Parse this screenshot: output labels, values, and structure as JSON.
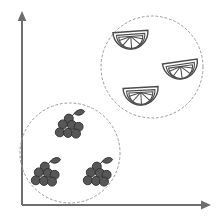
{
  "figure": {
    "type": "cluster-scatter-diagram",
    "background_color": "#ffffff",
    "width": 218,
    "height": 222
  },
  "axes": {
    "color": "#6e6e6e",
    "x_axis": {
      "name": "x-axis",
      "label": "",
      "from": [
        22,
        205
      ],
      "to": [
        208,
        205
      ],
      "arrow": "right"
    },
    "y_axis": {
      "name": "y-axis",
      "label": "",
      "from": [
        22,
        205
      ],
      "to": [
        22,
        14
      ],
      "arrow": "up"
    }
  },
  "clusters": [
    {
      "id": "citrus-cluster",
      "label": "",
      "ring_color": "#9b9b9b",
      "ring_style": "dashed",
      "center": [
        152,
        67
      ],
      "radius": 51,
      "member_icon": "citrus-slice-icon",
      "member_count": 3,
      "members": [
        {
          "id": "citrus-slice-1",
          "icon": "citrus-slice-icon",
          "center": [
            131,
            40
          ],
          "scale": 1.0,
          "rotation": -4
        },
        {
          "id": "citrus-slice-2",
          "icon": "citrus-slice-icon",
          "center": [
            181,
            70
          ],
          "scale": 1.0,
          "rotation": -8
        },
        {
          "id": "citrus-slice-3",
          "icon": "citrus-slice-icon",
          "center": [
            141,
            96
          ],
          "scale": 1.0,
          "rotation": -3
        }
      ]
    },
    {
      "id": "grape-cluster",
      "label": "",
      "ring_color": "#9b9b9b",
      "ring_style": "dashed",
      "center": [
        70,
        153
      ],
      "radius": 50,
      "member_icon": "grape-bunch-icon",
      "member_count": 3,
      "members": [
        {
          "id": "grape-bunch-1",
          "icon": "grape-bunch-icon",
          "center": [
            69,
            128
          ],
          "scale": 1.0,
          "rotation": 0
        },
        {
          "id": "grape-bunch-2",
          "icon": "grape-bunch-icon",
          "center": [
            45,
            176
          ],
          "scale": 1.0,
          "rotation": 0
        },
        {
          "id": "grape-bunch-3",
          "icon": "grape-bunch-icon",
          "center": [
            97,
            176
          ],
          "scale": 1.0,
          "rotation": 0
        }
      ]
    }
  ],
  "colors": {
    "axis": "#6e6e6e",
    "cluster_ring": "#9b9b9b",
    "citrus_outline": "#4a4a4a",
    "citrus_fill": "#ffffff",
    "grape_fill": "#575757",
    "grape_outline": "#2f2f2f"
  }
}
